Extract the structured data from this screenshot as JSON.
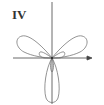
{
  "figure": {
    "label": "IV",
    "type": "polar-rose-curve",
    "axes": {
      "x_arrow": true,
      "y_arrow": true
    },
    "colors": {
      "curve": "#777777",
      "axis": "#444444",
      "label": "#333333"
    }
  }
}
